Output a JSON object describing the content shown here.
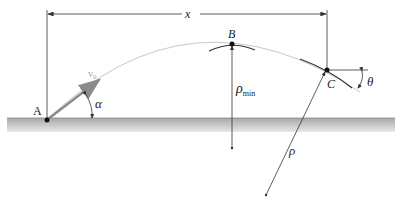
{
  "labels": {
    "point_a": "A",
    "point_b": "B",
    "point_c": "C",
    "distance": "x",
    "velocity": "v",
    "velocity_sub": "0",
    "launch_angle": "α",
    "impact_angle": "θ",
    "rho_min": "ρ",
    "rho_min_sub": "min",
    "rho": "ρ"
  },
  "colors": {
    "ground": "#b8b8b8",
    "trajectory": "#c8c8c8",
    "velocity_arrow": "#8a8a8a",
    "velocity_label": "#9aa0b4",
    "lines": "#333333"
  }
}
